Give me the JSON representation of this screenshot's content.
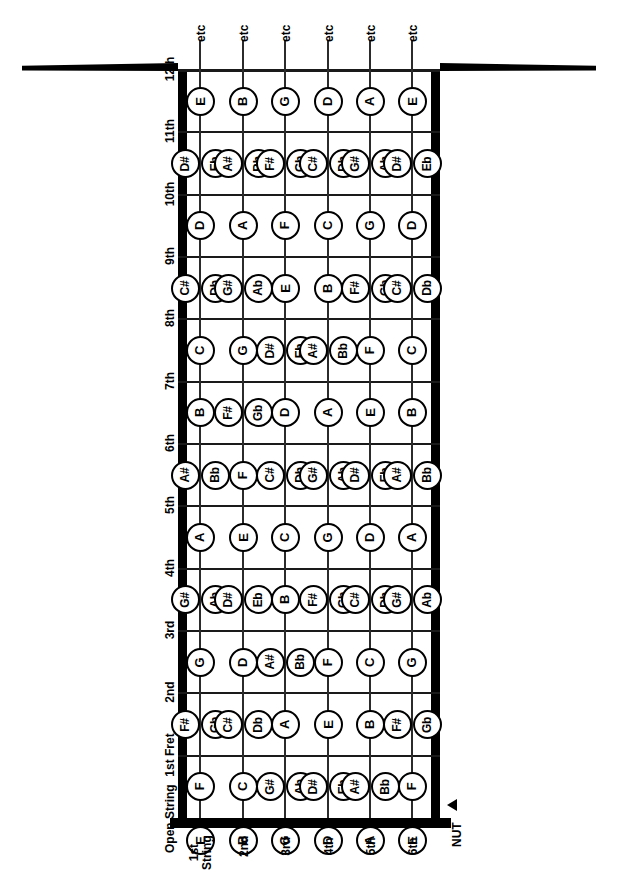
{
  "labels": {
    "nut": "NUT",
    "etc": "etc",
    "open_string": "Open\nString",
    "first_string": "1st\nString"
  },
  "fret_labels": [
    "Open\nString",
    "1st Fret",
    "2nd",
    "3rd",
    "4th",
    "5th",
    "6th",
    "7th",
    "8th",
    "9th",
    "10th",
    "11th",
    "12th"
  ],
  "string_labels": [
    "1st\nString",
    "2nd",
    "3rd",
    "4th",
    "5th",
    "6th"
  ],
  "string_open_notes": [
    "E",
    "B",
    "G",
    "D",
    "A",
    "E"
  ],
  "colors": {
    "ink": "#000000",
    "paper": "#ffffff",
    "line": "#2b2b2b"
  },
  "chart_data": {
    "type": "table",
    "xlabel": "String",
    "ylabel": "Fret",
    "categories": [
      "1st String",
      "2nd",
      "3rd",
      "4th",
      "5th",
      "6th"
    ],
    "frets": [
      "Open String",
      "1st Fret",
      "2nd",
      "3rd",
      "4th",
      "5th",
      "6th",
      "7th",
      "8th",
      "9th",
      "10th",
      "11th",
      "12th"
    ],
    "notes": [
      {
        "fret": "Open String",
        "values": [
          [
            "E"
          ],
          [
            "B"
          ],
          [
            "G"
          ],
          [
            "D"
          ],
          [
            "A"
          ],
          [
            "E"
          ]
        ]
      },
      {
        "fret": "1st Fret",
        "values": [
          [
            "F"
          ],
          [
            "C"
          ],
          [
            "G#",
            "Ab"
          ],
          [
            "D#",
            "Eb"
          ],
          [
            "A#",
            "Bb"
          ],
          [
            "F"
          ]
        ]
      },
      {
        "fret": "2nd",
        "values": [
          [
            "F#",
            "Gb"
          ],
          [
            "C#",
            "Db"
          ],
          [
            "A"
          ],
          [
            "E"
          ],
          [
            "B"
          ],
          [
            "F#",
            "Gb"
          ]
        ]
      },
      {
        "fret": "3rd",
        "values": [
          [
            "G"
          ],
          [
            "D"
          ],
          [
            "A#",
            "Bb"
          ],
          [
            "F"
          ],
          [
            "C"
          ],
          [
            "G"
          ]
        ]
      },
      {
        "fret": "4th",
        "values": [
          [
            "G#",
            "Ab"
          ],
          [
            "D#",
            "Eb"
          ],
          [
            "B"
          ],
          [
            "F#",
            "Gb"
          ],
          [
            "C#",
            "Db"
          ],
          [
            "G#",
            "Ab"
          ]
        ]
      },
      {
        "fret": "5th",
        "values": [
          [
            "A"
          ],
          [
            "E"
          ],
          [
            "C"
          ],
          [
            "G"
          ],
          [
            "D"
          ],
          [
            "A"
          ]
        ]
      },
      {
        "fret": "6th",
        "values": [
          [
            "A#",
            "Bb"
          ],
          [
            "F"
          ],
          [
            "C#",
            "Db"
          ],
          [
            "G#",
            "Ab"
          ],
          [
            "D#",
            "Eb"
          ],
          [
            "A#",
            "Bb"
          ]
        ]
      },
      {
        "fret": "7th",
        "values": [
          [
            "B"
          ],
          [
            "F#",
            "Gb"
          ],
          [
            "D"
          ],
          [
            "A"
          ],
          [
            "E"
          ],
          [
            "B"
          ]
        ]
      },
      {
        "fret": "8th",
        "values": [
          [
            "C"
          ],
          [
            "G"
          ],
          [
            "D#",
            "Eb"
          ],
          [
            "A#",
            "Bb"
          ],
          [
            "F"
          ],
          [
            "C"
          ]
        ]
      },
      {
        "fret": "9th",
        "values": [
          [
            "C#",
            "Db"
          ],
          [
            "G#",
            "Ab"
          ],
          [
            "E"
          ],
          [
            "B"
          ],
          [
            "F#",
            "Gb"
          ],
          [
            "C#",
            "Db"
          ]
        ]
      },
      {
        "fret": "10th",
        "values": [
          [
            "D"
          ],
          [
            "A"
          ],
          [
            "F"
          ],
          [
            "C"
          ],
          [
            "G"
          ],
          [
            "D"
          ]
        ]
      },
      {
        "fret": "11th",
        "values": [
          [
            "D#",
            "Eb"
          ],
          [
            "A#",
            "Bb"
          ],
          [
            "F#",
            "Gb"
          ],
          [
            "C#",
            "Db"
          ],
          [
            "G#",
            "Ab"
          ],
          [
            "D#",
            "Eb"
          ]
        ]
      },
      {
        "fret": "12th",
        "values": [
          [
            "E"
          ],
          [
            "B"
          ],
          [
            "G"
          ],
          [
            "D"
          ],
          [
            "A"
          ],
          [
            "E"
          ]
        ]
      }
    ]
  }
}
